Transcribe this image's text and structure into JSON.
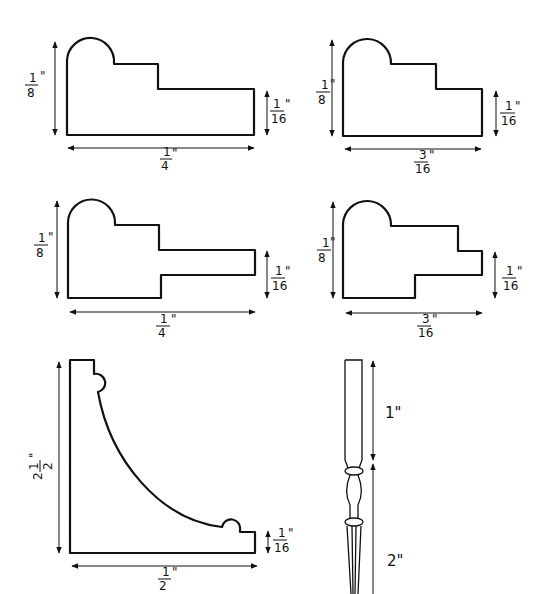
{
  "diagram": {
    "colors": {
      "ink": "#111111",
      "paper": "#ffffff"
    },
    "profiles": [
      {
        "id": "profile-a",
        "description": "Stepped molding with rounded bead at top left",
        "height_label": {
          "num": "1",
          "den": "8",
          "unit": "\""
        },
        "step_label": {
          "num": "1",
          "den": "16",
          "unit": "\""
        },
        "width_label": {
          "num": "1",
          "den": "4",
          "unit": "\""
        }
      },
      {
        "id": "profile-b",
        "description": "Stepped molding with rounded bead, narrower",
        "height_label": {
          "num": "1",
          "den": "8",
          "unit": "\""
        },
        "step_label": {
          "num": "1",
          "den": "16",
          "unit": "\""
        },
        "width_label": {
          "num": "3",
          "den": "16",
          "unit": "\""
        }
      },
      {
        "id": "profile-c",
        "description": "Molding with rounded bead and projecting tongue",
        "height_label": {
          "num": "1",
          "den": "8",
          "unit": "\""
        },
        "step_label": {
          "num": "1",
          "den": "16",
          "unit": "\""
        },
        "width_label": {
          "num": "1",
          "den": "4",
          "unit": "\""
        }
      },
      {
        "id": "profile-d",
        "description": "Molding with rounded bead and short tongue, narrower",
        "height_label": {
          "num": "1",
          "den": "8",
          "unit": "\""
        },
        "step_label": {
          "num": "1",
          "den": "16",
          "unit": "\""
        },
        "width_label": {
          "num": "3",
          "den": "16",
          "unit": "\""
        }
      },
      {
        "id": "profile-e",
        "description": "Cove molding with beads at both ends",
        "height_label": {
          "whole": "2",
          "num": "1",
          "den": "2",
          "unit": "\""
        },
        "step_label": {
          "num": "1",
          "den": "16",
          "unit": "\""
        },
        "width_label": {
          "num": "1",
          "den": "2",
          "unit": "\""
        }
      }
    ],
    "baluster": {
      "upper_label": "1\"",
      "lower_label": "2\""
    }
  }
}
